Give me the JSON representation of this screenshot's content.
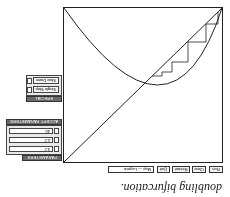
{
  "caption": "doubling bifurcation.",
  "map_selector": {
    "label": "Map — Logistic"
  },
  "buttons": {
    "run": "Run",
    "clear": "Clear",
    "restart": "Restart",
    "quit": "Quit"
  },
  "parameters_panel": {
    "title": "PARAMETERS",
    "fields": [
      {
        "label": "r",
        "value": "3.2"
      },
      {
        "label": "x0",
        "value": "0.2"
      },
      {
        "label": "n",
        "value": "40"
      }
    ],
    "accept_label": "ACCEPT PARAMETERS"
  },
  "special_effects_panel": {
    "title": "SPECIAL EFFECTS",
    "toggles": [
      {
        "label": "Single Step"
      },
      {
        "label": "Slow Down"
      }
    ]
  },
  "colors": {
    "line": "#222222",
    "header": "#6a6a6a",
    "panel": "#e9e9e9"
  }
}
